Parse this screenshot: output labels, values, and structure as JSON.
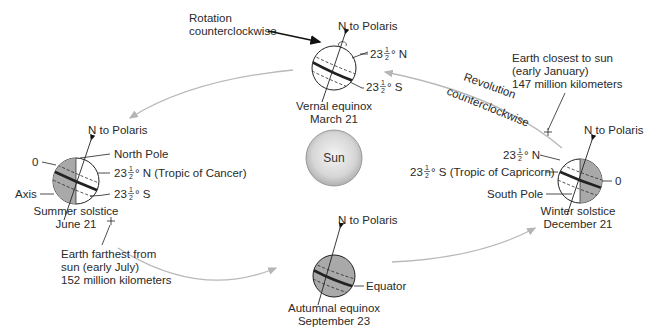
{
  "diagram": {
    "sun": {
      "label": "Sun"
    },
    "rotation": {
      "line1": "Rotation",
      "line2": "counterclockwise"
    },
    "revolution": {
      "line1": "Revolution",
      "line2": "counterclockwise"
    },
    "perihelion": {
      "line1": "Earth closest to sun",
      "line2": "(early January)",
      "line3": "147 million kilometers"
    },
    "aphelion": {
      "line1": "Earth farthest from",
      "line2": "sun (early July)",
      "line3": "152 million kilometers"
    },
    "positions": {
      "vernal": {
        "name": "Vernal equinox",
        "date": "March 21",
        "polaris": "N to Polaris",
        "lat_n_whole": "23",
        "lat_n_suffix": "° N",
        "lat_s_whole": "23",
        "lat_s_suffix": "° S"
      },
      "summer": {
        "name": "Summer solstice",
        "date": "June 21",
        "polaris": "N to Polaris",
        "north_pole": "North Pole",
        "zero": "0",
        "axis": "Axis",
        "lat_n_whole": "23",
        "lat_n_suffix": "° N (Tropic of Cancer)",
        "lat_s_whole": "23",
        "lat_s_suffix": "° S"
      },
      "autumnal": {
        "name": "Autumnal equinox",
        "date": "September 23",
        "polaris": "N to Polaris",
        "equator": "Equator"
      },
      "winter": {
        "name": "Winter solstice",
        "date": "December 21",
        "polaris": "N to Polaris",
        "south_pole": "South Pole",
        "zero": "0",
        "lat_n_whole": "23",
        "lat_n_suffix": "° N",
        "lat_s_whole": "23",
        "lat_s_suffix": "° S (Tropic of Capricorn)"
      }
    },
    "fraction": {
      "num": "1",
      "den": "2"
    },
    "colors": {
      "orbit": "#b8b8b8",
      "globe_dark": "#a9a9a9",
      "globe_light": "#ffffff",
      "sun_center": "#f2f2f2",
      "sun_edge": "#b5b5b5",
      "line": "#222222"
    }
  }
}
